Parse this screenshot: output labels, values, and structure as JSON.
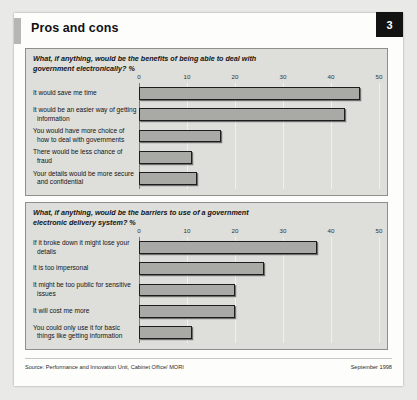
{
  "header": {
    "title": "Pros and cons",
    "page_number": "3"
  },
  "footer": {
    "source": "Source: Performance and Innovation Unit, Cabinet Office/ MORI",
    "date": "September 1998"
  },
  "colors": {
    "bar_fill": "#a9a9a5",
    "bar_border": "#1d1d1d",
    "panel_bg": "#dededa",
    "panel_border": "#8e8e8a",
    "badge_bg": "#121212",
    "accent_bar": "#b6b6b2"
  },
  "chart_data": [
    {
      "type": "bar",
      "orientation": "horizontal",
      "id": "benefits",
      "title": "What, if anything, would be the benefits of being able to deal with government electronically? %",
      "xlabel": "%",
      "ylabel": "",
      "xlim": [
        0,
        50
      ],
      "ticks": [
        0,
        10,
        20,
        30,
        40,
        50
      ],
      "tick_labels": [
        "0",
        "10",
        "20",
        "30",
        "40",
        "50"
      ],
      "grid": true,
      "legend": "none",
      "categories": [
        "It would save me time",
        "It would be an easier way of getting information",
        "You would have more choice of how to deal with governments",
        "There would be less chance of fraud",
        "Your details would be more secure and confidential"
      ],
      "values": [
        46,
        43,
        17,
        11,
        12
      ]
    },
    {
      "type": "bar",
      "orientation": "horizontal",
      "id": "barriers",
      "title": "What, if anything, would be the barriers to use of a government electronic delivery system? %",
      "xlabel": "%",
      "ylabel": "",
      "xlim": [
        0,
        50
      ],
      "ticks": [
        0,
        10,
        20,
        30,
        40,
        50
      ],
      "tick_labels": [
        "0",
        "10",
        "20",
        "30",
        "40",
        "50"
      ],
      "grid": true,
      "legend": "none",
      "categories": [
        "If it broke down it might lose your details",
        "It is too impersonal",
        "It might be too public for sensitive issues",
        "It will cost me more",
        "You could only use it for basic things like getting information"
      ],
      "values": [
        37,
        26,
        20,
        20,
        11
      ]
    }
  ]
}
